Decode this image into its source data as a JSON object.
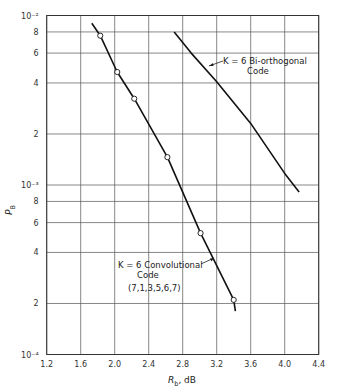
{
  "chart_data": {
    "type": "line",
    "title": "",
    "xlabel": "R_b, dB",
    "ylabel": "P_B",
    "xlim": [
      1.2,
      4.4
    ],
    "ylim": [
      0.0001,
      0.01
    ],
    "yscale": "log",
    "grid": true,
    "x_ticks": [
      1.2,
      1.6,
      2.0,
      2.4,
      2.8,
      3.2,
      3.6,
      4.0,
      4.4
    ],
    "x_tick_labels": [
      "1.2",
      "1.6",
      "2.0",
      "2.4",
      "2.8",
      "3.2",
      "3.6",
      "4.0",
      "4.4"
    ],
    "y_ticks": [
      0.01,
      0.008,
      0.006,
      0.004,
      0.002,
      0.001,
      0.0008,
      0.0006,
      0.0004,
      0.0002,
      0.0001
    ],
    "y_tick_labels": [
      "10⁻²",
      "8",
      "6",
      "4",
      "2",
      "10⁻³",
      "8",
      "6",
      "4",
      "2",
      "10⁻⁴"
    ],
    "series": [
      {
        "name": "K = 6 Convolutional Code (7,1,3,5,6,7)",
        "label_lines": [
          "K = 6  Convolutional",
          "Code",
          "(7,1,3,5,6,7)"
        ],
        "line": {
          "x": [
            1.73,
            1.83,
            2.03,
            2.23,
            2.62,
            3.01,
            3.4,
            3.42
          ],
          "y": [
            0.009,
            0.0076,
            0.00464,
            0.00323,
            0.00146,
            0.00052,
            0.00021,
            0.00018
          ]
        },
        "markers": {
          "x": [
            1.83,
            2.03,
            2.23,
            2.62,
            3.01,
            3.4
          ],
          "y": [
            0.0076,
            0.00464,
            0.00323,
            0.00146,
            0.00052,
            0.00021
          ]
        }
      },
      {
        "name": "K = 6 Bi-orthogonal Code",
        "label_lines": [
          "K = 6  Bi-orthogonal",
          "Code"
        ],
        "line": {
          "x": [
            2.7,
            2.9,
            3.2,
            3.6,
            4.0,
            4.17
          ],
          "y": [
            0.008,
            0.006,
            0.00407,
            0.00231,
            0.00117,
            0.00091
          ]
        },
        "markers": null
      }
    ]
  }
}
